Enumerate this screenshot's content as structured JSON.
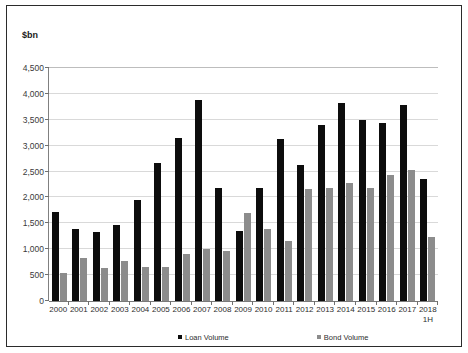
{
  "chart_data": {
    "type": "bar",
    "title": "",
    "subtitle": "",
    "xlabel": "",
    "ylabel": "$bn",
    "ylim": [
      0,
      4500
    ],
    "ytick_step": 500,
    "grid": true,
    "legend_position": "bottom",
    "categories": [
      "2000",
      "2001",
      "2002",
      "2003",
      "2004",
      "2005",
      "2006",
      "2007",
      "2008",
      "2009",
      "2010",
      "2011",
      "2012",
      "2013",
      "2014",
      "2015",
      "2016",
      "2017",
      "2018\n1H"
    ],
    "ytick_labels": [
      "4,500",
      "4,000",
      "3,500",
      "3,000",
      "2,500",
      "2,000",
      "1,500",
      "1,000",
      "500",
      "0"
    ],
    "ytick_values": [
      4500,
      4000,
      3500,
      3000,
      2500,
      2000,
      1500,
      1000,
      500,
      0
    ],
    "series": [
      {
        "name": "Loan Volume",
        "color": "#0d0d0d",
        "values": [
          1720,
          1400,
          1330,
          1460,
          1950,
          2670,
          3150,
          3890,
          2190,
          1350,
          2180,
          3130,
          2630,
          3390,
          3820,
          3500,
          3440,
          3790,
          2360
        ]
      },
      {
        "name": "Bond Volume",
        "color": "#8c8c8c",
        "values": [
          550,
          840,
          630,
          780,
          650,
          650,
          900,
          1010,
          960,
          1700,
          1400,
          1160,
          2170,
          2190,
          2270,
          2180,
          2430,
          2530,
          1230
        ]
      }
    ]
  },
  "axis": {
    "y_title": "$bn"
  },
  "legend": {
    "items": [
      {
        "label": "Loan Volume",
        "marker": "filled-square-black"
      },
      {
        "label": "Bond Volume",
        "marker": "filled-square-gray"
      }
    ]
  }
}
